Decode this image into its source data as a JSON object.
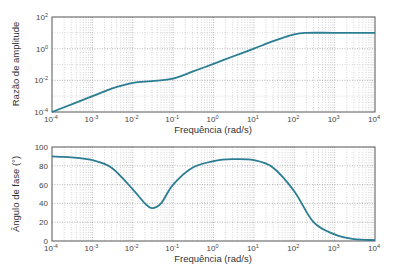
{
  "chart_data": [
    {
      "type": "line",
      "title": "",
      "xlabel": "Frequência (rad/s)",
      "ylabel": "Razão de amplitude",
      "xscale": "log",
      "yscale": "log",
      "xlim": [
        0.0001,
        10000
      ],
      "ylim": [
        0.0001,
        100
      ],
      "xticks": [
        "10^-4",
        "10^-3",
        "10^-2",
        "10^-1",
        "10^0",
        "10^1",
        "10^2",
        "10^3",
        "10^4"
      ],
      "yticks": [
        "10^-4",
        "10^-2",
        "10^0",
        "10^2"
      ],
      "grid": true,
      "series": [
        {
          "name": "Razão de amplitude",
          "color": "#2a7d93",
          "x": [
            0.0001,
            0.001,
            0.003,
            0.01,
            0.03,
            0.1,
            0.3,
            1,
            3,
            10,
            30,
            100,
            200,
            1000,
            10000
          ],
          "y": [
            0.0001,
            0.001,
            0.003,
            0.007,
            0.009,
            0.013,
            0.035,
            0.11,
            0.32,
            1.0,
            3.0,
            8.0,
            10.0,
            10.0,
            10.0
          ]
        }
      ]
    },
    {
      "type": "line",
      "title": "",
      "xlabel": "Frequência (rad/s)",
      "ylabel": "Ângulo de fase (°)",
      "xscale": "log",
      "yscale": "linear",
      "xlim": [
        0.0001,
        10000
      ],
      "ylim": [
        0,
        100
      ],
      "xticks": [
        "10^-4",
        "10^-3",
        "10^-2",
        "10^-1",
        "10^0",
        "10^1",
        "10^2",
        "10^3",
        "10^4"
      ],
      "yticks": [
        0,
        20,
        40,
        60,
        80,
        100
      ],
      "grid": true,
      "series": [
        {
          "name": "Ângulo de fase",
          "color": "#2a7d93",
          "x": [
            0.0001,
            0.0003,
            0.001,
            0.003,
            0.01,
            0.02,
            0.03,
            0.05,
            0.1,
            0.3,
            1,
            3,
            10,
            30,
            100,
            300,
            1000,
            3000,
            10000
          ],
          "y": [
            90,
            89,
            86,
            78,
            55,
            40,
            35,
            40,
            60,
            78,
            85,
            87,
            86,
            78,
            53,
            20,
            7,
            2,
            1
          ]
        }
      ]
    }
  ],
  "labels": {
    "top_ylabel": "Razão de amplitude",
    "bottom_ylabel": "Ângulo de fase (°)",
    "xlabel": "Frequência (rad/s)"
  }
}
